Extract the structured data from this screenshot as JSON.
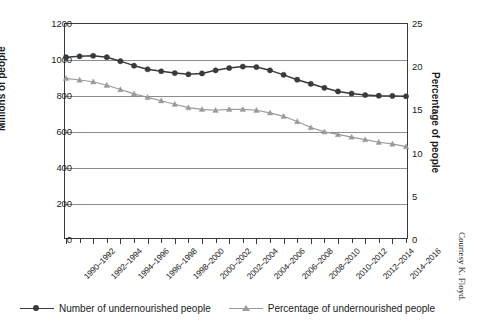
{
  "chart_data": {
    "type": "line",
    "title": "",
    "xlabel": "",
    "ylabel": "Millions of people",
    "y2label": "Percentage of people",
    "grid": true,
    "legend_position": "bottom",
    "ylim": [
      0,
      1200
    ],
    "y2lim": [
      0,
      25
    ],
    "y_ticks": [
      0,
      200,
      400,
      600,
      800,
      1000,
      1200
    ],
    "y2_ticks": [
      0,
      5,
      10,
      15,
      20,
      25
    ],
    "y_tick_labels": [
      "0",
      "200",
      "400",
      "600",
      "800",
      "1000",
      "1200"
    ],
    "y2_tick_labels": [
      "0",
      "5",
      "10",
      "15",
      "20",
      "25"
    ],
    "categories": [
      "1990–1992",
      "1991–1993",
      "1992–1994",
      "1993–1995",
      "1994–1996",
      "1995–1997",
      "1996–1998",
      "1997–1999",
      "1998–2000",
      "1999–2001",
      "2000–2002",
      "2001–2003",
      "2002–2004",
      "2003–2005",
      "2004–2006",
      "2005–2007",
      "2006–2008",
      "2007–2009",
      "2008–2010",
      "2009–2011",
      "2010–2012",
      "2011–2013",
      "2012–2014",
      "2013–2015",
      "2014–2016",
      "2015–2017"
    ],
    "labeled_categories": [
      "1990–1992",
      "1992–1994",
      "1994–1996",
      "1996–1998",
      "1998–2000",
      "2000–2002",
      "2002–2004",
      "2004–2006",
      "2006–2008",
      "2008–2010",
      "2010–2012",
      "2012–2014",
      "2014–2016"
    ],
    "series": [
      {
        "name": "Number of undernourished people",
        "axis": "left",
        "unit": "millions",
        "color": "#3a3a3a",
        "marker": "circle",
        "values": [
          1010,
          1015,
          1018,
          1010,
          988,
          963,
          943,
          932,
          922,
          915,
          920,
          937,
          950,
          958,
          955,
          937,
          912,
          885,
          862,
          840,
          820,
          808,
          800,
          796,
          795,
          793
        ]
      },
      {
        "name": "Percentage of undernourished people",
        "axis": "right",
        "unit": "percent",
        "color": "#9a9a9a",
        "marker": "triangle",
        "values": [
          18.6,
          18.4,
          18.2,
          17.8,
          17.3,
          16.8,
          16.4,
          16.0,
          15.6,
          15.2,
          15.0,
          14.9,
          15.0,
          15.0,
          14.9,
          14.6,
          14.2,
          13.6,
          12.9,
          12.4,
          12.1,
          11.8,
          11.5,
          11.2,
          11.0,
          10.7
        ]
      }
    ]
  },
  "credit": {
    "text": "Courtesy K. Floyd."
  }
}
